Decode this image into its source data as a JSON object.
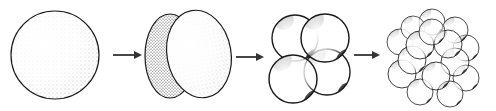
{
  "diagram": {
    "type": "cell-cleavage-sequence",
    "background": "#ffffff",
    "stroke": "#1a1a1a",
    "stages": [
      {
        "name": "zygote",
        "cells": 1
      },
      {
        "name": "two-cell",
        "cells": 2
      },
      {
        "name": "four-cell",
        "cells": 4
      },
      {
        "name": "morula",
        "cells": 16
      }
    ],
    "arrows": 3
  }
}
